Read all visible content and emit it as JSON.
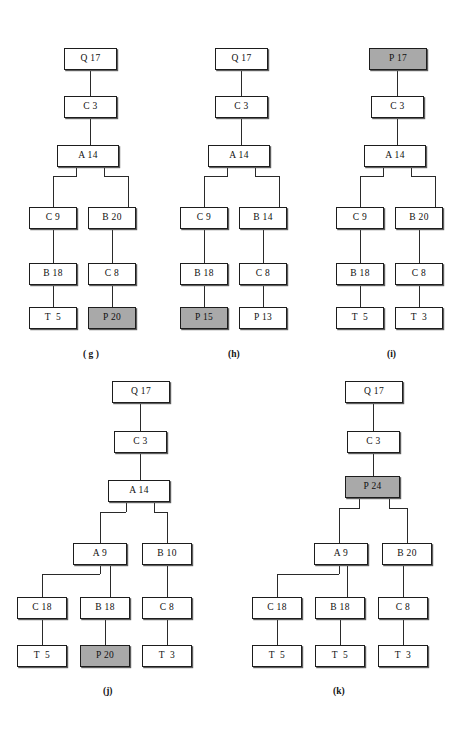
{
  "figure": {
    "background": "#ffffff",
    "node_fill": "#ffffff",
    "node_highlight_fill": "#a9a9a9",
    "node_border": "#1d1d1d",
    "edge_color": "#2a2a2a"
  },
  "diagrams": [
    {
      "id": "g",
      "caption": "( g )",
      "caption_x": 83,
      "caption_y": 349,
      "origin_x": 0,
      "origin_y": 0,
      "nodes": [
        {
          "name": "node-q17",
          "label": "Q 17",
          "x": 64,
          "y": 48,
          "w": 53,
          "h": 22,
          "highlight": false
        },
        {
          "name": "node-c3",
          "label": "C 3",
          "x": 64,
          "y": 96,
          "w": 53,
          "h": 22,
          "highlight": false
        },
        {
          "name": "node-a14",
          "label": "A 14",
          "x": 57,
          "y": 145,
          "w": 62,
          "h": 22,
          "highlight": false
        },
        {
          "name": "node-c9",
          "label": "C 9",
          "x": 29,
          "y": 207,
          "w": 48,
          "h": 22,
          "highlight": false
        },
        {
          "name": "node-b20",
          "label": "B 20",
          "x": 88,
          "y": 207,
          "w": 48,
          "h": 22,
          "highlight": false
        },
        {
          "name": "node-b18",
          "label": "B 18",
          "x": 29,
          "y": 263,
          "w": 48,
          "h": 22,
          "highlight": false
        },
        {
          "name": "node-c8",
          "label": "C 8",
          "x": 88,
          "y": 263,
          "w": 48,
          "h": 22,
          "highlight": false
        },
        {
          "name": "node-t5",
          "label": "T  5",
          "x": 29,
          "y": 307,
          "w": 48,
          "h": 22,
          "highlight": false
        },
        {
          "name": "node-p20",
          "label": "P 20",
          "x": 88,
          "y": 307,
          "w": 48,
          "h": 22,
          "highlight": true
        }
      ],
      "edges": [
        {
          "type": "v",
          "x": 90,
          "y": 70,
          "len": 26
        },
        {
          "type": "v",
          "x": 90,
          "y": 118,
          "len": 27
        },
        {
          "type": "v",
          "x": 76,
          "y": 167,
          "len": 9
        },
        {
          "type": "v",
          "x": 104,
          "y": 167,
          "len": 9
        },
        {
          "type": "h",
          "x": 53,
          "y": 176,
          "len": 24
        },
        {
          "type": "h",
          "x": 104,
          "y": 176,
          "len": 24
        },
        {
          "type": "v",
          "x": 53,
          "y": 176,
          "len": 31
        },
        {
          "type": "v",
          "x": 128,
          "y": 176,
          "len": 31
        },
        {
          "type": "v",
          "x": 53,
          "y": 229,
          "len": 34
        },
        {
          "type": "v",
          "x": 112,
          "y": 229,
          "len": 34
        },
        {
          "type": "v",
          "x": 53,
          "y": 285,
          "len": 22
        },
        {
          "type": "v",
          "x": 112,
          "y": 285,
          "len": 22
        }
      ]
    },
    {
      "id": "h",
      "caption": "(h)",
      "caption_x": 228,
      "caption_y": 349,
      "origin_x": 0,
      "origin_y": 0,
      "nodes": [
        {
          "name": "node-q17",
          "label": "Q 17",
          "x": 215,
          "y": 48,
          "w": 53,
          "h": 22,
          "highlight": false
        },
        {
          "name": "node-c3",
          "label": "C 3",
          "x": 215,
          "y": 96,
          "w": 53,
          "h": 22,
          "highlight": false
        },
        {
          "name": "node-a14",
          "label": "A 14",
          "x": 208,
          "y": 145,
          "w": 62,
          "h": 22,
          "highlight": false
        },
        {
          "name": "node-c9",
          "label": "C 9",
          "x": 180,
          "y": 207,
          "w": 48,
          "h": 22,
          "highlight": false
        },
        {
          "name": "node-b14",
          "label": "B 14",
          "x": 239,
          "y": 207,
          "w": 48,
          "h": 22,
          "highlight": false
        },
        {
          "name": "node-b18",
          "label": "B 18",
          "x": 180,
          "y": 263,
          "w": 48,
          "h": 22,
          "highlight": false
        },
        {
          "name": "node-c8",
          "label": "C 8",
          "x": 239,
          "y": 263,
          "w": 48,
          "h": 22,
          "highlight": false
        },
        {
          "name": "node-p15",
          "label": "P 15",
          "x": 180,
          "y": 307,
          "w": 48,
          "h": 22,
          "highlight": true
        },
        {
          "name": "node-p13",
          "label": "P 13",
          "x": 239,
          "y": 307,
          "w": 48,
          "h": 22,
          "highlight": false
        }
      ],
      "edges": [
        {
          "type": "v",
          "x": 241,
          "y": 70,
          "len": 26
        },
        {
          "type": "v",
          "x": 241,
          "y": 118,
          "len": 27
        },
        {
          "type": "v",
          "x": 227,
          "y": 167,
          "len": 9
        },
        {
          "type": "v",
          "x": 255,
          "y": 167,
          "len": 9
        },
        {
          "type": "h",
          "x": 204,
          "y": 176,
          "len": 24
        },
        {
          "type": "h",
          "x": 255,
          "y": 176,
          "len": 24
        },
        {
          "type": "v",
          "x": 204,
          "y": 176,
          "len": 31
        },
        {
          "type": "v",
          "x": 279,
          "y": 176,
          "len": 31
        },
        {
          "type": "v",
          "x": 204,
          "y": 229,
          "len": 34
        },
        {
          "type": "v",
          "x": 263,
          "y": 229,
          "len": 34
        },
        {
          "type": "v",
          "x": 204,
          "y": 285,
          "len": 22
        },
        {
          "type": "v",
          "x": 263,
          "y": 285,
          "len": 22
        }
      ]
    },
    {
      "id": "i",
      "caption": "(i)",
      "caption_x": 387,
      "caption_y": 349,
      "origin_x": 0,
      "origin_y": 0,
      "nodes": [
        {
          "name": "node-p17",
          "label": "P 17",
          "x": 369,
          "y": 48,
          "w": 58,
          "h": 22,
          "highlight": true
        },
        {
          "name": "node-c3",
          "label": "C 3",
          "x": 371,
          "y": 96,
          "w": 53,
          "h": 22,
          "highlight": false
        },
        {
          "name": "node-a14",
          "label": "A 14",
          "x": 364,
          "y": 145,
          "w": 62,
          "h": 22,
          "highlight": false
        },
        {
          "name": "node-c9",
          "label": "C 9",
          "x": 336,
          "y": 207,
          "w": 48,
          "h": 22,
          "highlight": false
        },
        {
          "name": "node-b20",
          "label": "B 20",
          "x": 395,
          "y": 207,
          "w": 48,
          "h": 22,
          "highlight": false
        },
        {
          "name": "node-b18",
          "label": "B 18",
          "x": 336,
          "y": 263,
          "w": 48,
          "h": 22,
          "highlight": false
        },
        {
          "name": "node-c8",
          "label": "C 8",
          "x": 395,
          "y": 263,
          "w": 48,
          "h": 22,
          "highlight": false
        },
        {
          "name": "node-t5",
          "label": "T  5",
          "x": 336,
          "y": 307,
          "w": 48,
          "h": 22,
          "highlight": false
        },
        {
          "name": "node-t3",
          "label": "T  3",
          "x": 395,
          "y": 307,
          "w": 48,
          "h": 22,
          "highlight": false
        }
      ],
      "edges": [
        {
          "type": "v",
          "x": 397,
          "y": 70,
          "len": 26
        },
        {
          "type": "v",
          "x": 397,
          "y": 118,
          "len": 27
        },
        {
          "type": "v",
          "x": 383,
          "y": 167,
          "len": 9
        },
        {
          "type": "v",
          "x": 411,
          "y": 167,
          "len": 9
        },
        {
          "type": "h",
          "x": 360,
          "y": 176,
          "len": 24
        },
        {
          "type": "h",
          "x": 411,
          "y": 176,
          "len": 24
        },
        {
          "type": "v",
          "x": 360,
          "y": 176,
          "len": 31
        },
        {
          "type": "v",
          "x": 435,
          "y": 176,
          "len": 31
        },
        {
          "type": "v",
          "x": 360,
          "y": 229,
          "len": 34
        },
        {
          "type": "v",
          "x": 419,
          "y": 229,
          "len": 34
        },
        {
          "type": "v",
          "x": 360,
          "y": 285,
          "len": 22
        },
        {
          "type": "v",
          "x": 419,
          "y": 285,
          "len": 22
        }
      ]
    },
    {
      "id": "j",
      "caption": "(j)",
      "caption_x": 103,
      "caption_y": 686,
      "origin_x": 0,
      "origin_y": 0,
      "nodes": [
        {
          "name": "node-q17",
          "label": "Q 17",
          "x": 112,
          "y": 381,
          "w": 58,
          "h": 22,
          "highlight": false
        },
        {
          "name": "node-c3",
          "label": "C 3",
          "x": 114,
          "y": 431,
          "w": 53,
          "h": 22,
          "highlight": false
        },
        {
          "name": "node-a14",
          "label": "A 14",
          "x": 108,
          "y": 480,
          "w": 62,
          "h": 22,
          "highlight": false
        },
        {
          "name": "node-a9",
          "label": "A 9",
          "x": 73,
          "y": 543,
          "w": 54,
          "h": 22,
          "highlight": false
        },
        {
          "name": "node-b10",
          "label": "B 10",
          "x": 142,
          "y": 543,
          "w": 50,
          "h": 22,
          "highlight": false
        },
        {
          "name": "node-c18",
          "label": "C 18",
          "x": 17,
          "y": 597,
          "w": 50,
          "h": 22,
          "highlight": false
        },
        {
          "name": "node-b18",
          "label": "B 18",
          "x": 80,
          "y": 597,
          "w": 50,
          "h": 22,
          "highlight": false
        },
        {
          "name": "node-c8",
          "label": "C 8",
          "x": 142,
          "y": 597,
          "w": 50,
          "h": 22,
          "highlight": false
        },
        {
          "name": "node-t5",
          "label": "T  5",
          "x": 17,
          "y": 645,
          "w": 50,
          "h": 22,
          "highlight": false
        },
        {
          "name": "node-p20",
          "label": "P 20",
          "x": 80,
          "y": 645,
          "w": 50,
          "h": 22,
          "highlight": true
        },
        {
          "name": "node-t3",
          "label": "T  3",
          "x": 142,
          "y": 645,
          "w": 50,
          "h": 22,
          "highlight": false
        }
      ],
      "edges": [
        {
          "type": "v",
          "x": 140,
          "y": 403,
          "len": 28
        },
        {
          "type": "v",
          "x": 140,
          "y": 453,
          "len": 27
        },
        {
          "type": "v",
          "x": 126,
          "y": 502,
          "len": 10
        },
        {
          "type": "v",
          "x": 154,
          "y": 502,
          "len": 10
        },
        {
          "type": "h",
          "x": 100,
          "y": 512,
          "len": 26
        },
        {
          "type": "h",
          "x": 154,
          "y": 512,
          "len": 13
        },
        {
          "type": "v",
          "x": 100,
          "y": 512,
          "len": 31
        },
        {
          "type": "v",
          "x": 167,
          "y": 512,
          "len": 31
        },
        {
          "type": "v",
          "x": 100,
          "y": 565,
          "len": 9
        },
        {
          "type": "v",
          "x": 110,
          "y": 565,
          "len": 32
        },
        {
          "type": "h",
          "x": 42,
          "y": 574,
          "len": 58
        },
        {
          "type": "v",
          "x": 42,
          "y": 574,
          "len": 23
        },
        {
          "type": "v",
          "x": 167,
          "y": 565,
          "len": 32
        },
        {
          "type": "v",
          "x": 42,
          "y": 619,
          "len": 26
        },
        {
          "type": "v",
          "x": 105,
          "y": 619,
          "len": 26
        },
        {
          "type": "v",
          "x": 167,
          "y": 619,
          "len": 26
        }
      ]
    },
    {
      "id": "k",
      "caption": "(k)",
      "caption_x": 333,
      "caption_y": 686,
      "origin_x": 0,
      "origin_y": 0,
      "nodes": [
        {
          "name": "node-q17",
          "label": "Q 17",
          "x": 345,
          "y": 381,
          "w": 58,
          "h": 22,
          "highlight": false
        },
        {
          "name": "node-c3",
          "label": "C 3",
          "x": 347,
          "y": 431,
          "w": 53,
          "h": 22,
          "highlight": false
        },
        {
          "name": "node-p24",
          "label": "P 24",
          "x": 345,
          "y": 476,
          "w": 55,
          "h": 22,
          "highlight": true
        },
        {
          "name": "node-a9",
          "label": "A 9",
          "x": 314,
          "y": 543,
          "w": 54,
          "h": 22,
          "highlight": false
        },
        {
          "name": "node-b20",
          "label": "B 20",
          "x": 382,
          "y": 543,
          "w": 50,
          "h": 22,
          "highlight": false
        },
        {
          "name": "node-c18",
          "label": "C 18",
          "x": 252,
          "y": 597,
          "w": 50,
          "h": 22,
          "highlight": false
        },
        {
          "name": "node-b18",
          "label": "B 18",
          "x": 315,
          "y": 597,
          "w": 50,
          "h": 22,
          "highlight": false
        },
        {
          "name": "node-c8",
          "label": "C 8",
          "x": 378,
          "y": 597,
          "w": 50,
          "h": 22,
          "highlight": false
        },
        {
          "name": "node-t5-left",
          "label": "T  5",
          "x": 252,
          "y": 645,
          "w": 50,
          "h": 22,
          "highlight": false
        },
        {
          "name": "node-t5-mid",
          "label": "T  5",
          "x": 315,
          "y": 645,
          "w": 50,
          "h": 22,
          "highlight": false
        },
        {
          "name": "node-t3",
          "label": "T  3",
          "x": 378,
          "y": 645,
          "w": 50,
          "h": 22,
          "highlight": false
        }
      ],
      "edges": [
        {
          "type": "v",
          "x": 373,
          "y": 403,
          "len": 28
        },
        {
          "type": "v",
          "x": 373,
          "y": 453,
          "len": 23
        },
        {
          "type": "v",
          "x": 359,
          "y": 498,
          "len": 10
        },
        {
          "type": "v",
          "x": 389,
          "y": 498,
          "len": 10
        },
        {
          "type": "h",
          "x": 339,
          "y": 508,
          "len": 21
        },
        {
          "type": "h",
          "x": 389,
          "y": 508,
          "len": 18
        },
        {
          "type": "v",
          "x": 339,
          "y": 508,
          "len": 35
        },
        {
          "type": "v",
          "x": 407,
          "y": 508,
          "len": 35
        },
        {
          "type": "v",
          "x": 339,
          "y": 565,
          "len": 9
        },
        {
          "type": "v",
          "x": 347,
          "y": 565,
          "len": 32
        },
        {
          "type": "h",
          "x": 277,
          "y": 574,
          "len": 62
        },
        {
          "type": "v",
          "x": 277,
          "y": 574,
          "len": 23
        },
        {
          "type": "v",
          "x": 403,
          "y": 565,
          "len": 32
        },
        {
          "type": "v",
          "x": 277,
          "y": 619,
          "len": 26
        },
        {
          "type": "v",
          "x": 340,
          "y": 619,
          "len": 26
        },
        {
          "type": "v",
          "x": 403,
          "y": 619,
          "len": 26
        }
      ]
    }
  ]
}
